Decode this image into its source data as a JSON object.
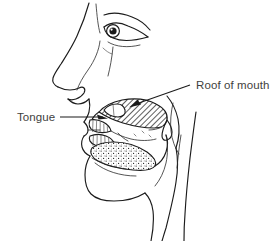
{
  "diagram": {
    "view": "left lateral profile, facing left",
    "style": "black and white line drawing with hatching and stipple shading",
    "background_color": "#ffffff",
    "line_color": "#1b1b1b",
    "label_color": "#3f3f40"
  },
  "labels": [
    {
      "id": "tongue",
      "text": "Tongue",
      "text_x": 17,
      "text_y": 121,
      "anchor": "start",
      "leader": {
        "from_x": 60,
        "from_y": 117,
        "to_x": 104,
        "to_y": 117,
        "arrow_direction": "right"
      },
      "points_to": "tongue body inside the mouth"
    },
    {
      "id": "roof-of-mouth",
      "text": "Roof of mouth",
      "text_x": 196,
      "text_y": 89,
      "anchor": "start",
      "leader": {
        "from_x": 190,
        "from_y": 85,
        "to_x": 133,
        "to_y": 106,
        "arrow_direction": "down-left"
      },
      "points_to": "hatched palate region at top of mouth cavity"
    }
  ],
  "anatomy_parts": [
    {
      "id": "face-profile",
      "name": "face profile outline",
      "shading": "none"
    },
    {
      "id": "nose",
      "name": "nose",
      "shading": "none"
    },
    {
      "id": "eye",
      "name": "eye",
      "shading": "iris filled dark"
    },
    {
      "id": "lips",
      "name": "lips",
      "shading": "none"
    },
    {
      "id": "upper-teeth",
      "name": "upper teeth",
      "shading": "vertical line detail"
    },
    {
      "id": "lower-teeth",
      "name": "lower teeth",
      "shading": "vertical line detail"
    },
    {
      "id": "hard-palate",
      "name": "hard palate / roof of mouth",
      "shading": "diagonal hatching"
    },
    {
      "id": "soft-palate",
      "name": "soft palate",
      "shading": "diagonal hatching"
    },
    {
      "id": "uvula",
      "name": "uvula",
      "shading": "outline"
    },
    {
      "id": "tongue-body",
      "name": "tongue",
      "shading": "stipple dots"
    },
    {
      "id": "jaw-chin",
      "name": "jaw and chin",
      "shading": "none"
    },
    {
      "id": "neck",
      "name": "neck",
      "shading": "none"
    },
    {
      "id": "pharynx",
      "name": "throat / pharynx",
      "shading": "none"
    }
  ]
}
